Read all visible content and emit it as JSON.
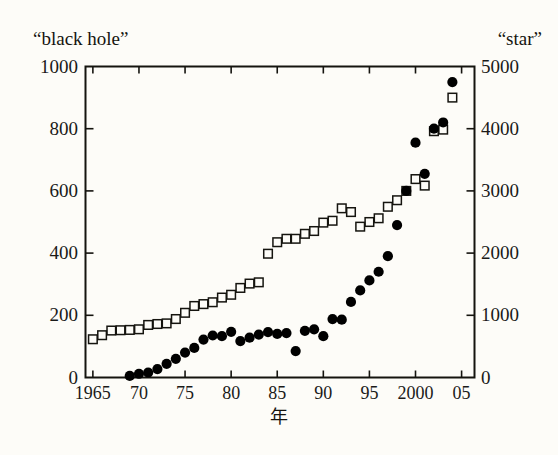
{
  "figure": {
    "background_color": "#fdfcf8",
    "ink_color": "#15140f",
    "left_header": "“black hole”",
    "right_header": "“star”",
    "xaxis_title": "年"
  },
  "chart_data": {
    "type": "scatter",
    "title": "",
    "subtitle": "",
    "xlabel": "年",
    "ylabel": "“black hole”",
    "y2label": "“star”",
    "xlim": [
      1964.2,
      2006.4
    ],
    "ylim": [
      0,
      1000
    ],
    "y2lim": [
      0,
      5000
    ],
    "grid": false,
    "legend_position": "none",
    "xticks": [
      1965,
      1970,
      1975,
      1980,
      1985,
      1990,
      1995,
      2000,
      2005
    ],
    "xtick_labels": [
      "1965",
      "70",
      "75",
      "80",
      "85",
      "90",
      "95",
      "2000",
      "05"
    ],
    "yticks": [
      0,
      200,
      400,
      600,
      800,
      1000
    ],
    "ytick_labels": [
      "0",
      "200",
      "400",
      "600",
      "800",
      "1000"
    ],
    "y2ticks": [
      0,
      1000,
      2000,
      3000,
      4000,
      5000
    ],
    "y2tick_labels": [
      "0",
      "1000",
      "2000",
      "3000",
      "4000",
      "5000"
    ],
    "series": [
      {
        "name": "“star”",
        "marker": "open-square",
        "axis": "right",
        "color": "#15140f",
        "x": [
          1965,
          1966,
          1967,
          1968,
          1969,
          1970,
          1971,
          1972,
          1973,
          1974,
          1975,
          1976,
          1977,
          1978,
          1979,
          1980,
          1981,
          1982,
          1983,
          1984,
          1985,
          1986,
          1987,
          1988,
          1989,
          1990,
          1991,
          1992,
          1993,
          1994,
          1995,
          1996,
          1997,
          1998,
          1999,
          2000,
          2001,
          2002,
          2003,
          2004
        ],
        "values": [
          615,
          680,
          755,
          760,
          765,
          775,
          845,
          860,
          870,
          940,
          1040,
          1150,
          1180,
          1210,
          1285,
          1330,
          1440,
          1510,
          1530,
          1990,
          2175,
          2230,
          2230,
          2310,
          2355,
          2490,
          2520,
          2720,
          2660,
          2425,
          2500,
          2560,
          2745,
          2850,
          3000,
          3190,
          3085,
          3960,
          3985,
          4500
        ],
        "values_left_axis": [
          123,
          136,
          151,
          152,
          153,
          155,
          169,
          172,
          174,
          188,
          208,
          230,
          236,
          242,
          257,
          266,
          288,
          302,
          306,
          398,
          435,
          446,
          446,
          462,
          471,
          498,
          504,
          544,
          532,
          485,
          500,
          512,
          549,
          570,
          600,
          638,
          617,
          792,
          797,
          900
        ]
      },
      {
        "name": "“black hole”",
        "marker": "filled-circle",
        "axis": "left",
        "color": "#000000",
        "x": [
          1969,
          1970,
          1971,
          1972,
          1973,
          1974,
          1975,
          1976,
          1977,
          1978,
          1979,
          1980,
          1981,
          1982,
          1983,
          1984,
          1985,
          1986,
          1987,
          1988,
          1989,
          1990,
          1991,
          1992,
          1993,
          1994,
          1995,
          1996,
          1997,
          1998,
          1999,
          2000,
          2001,
          2002,
          2003,
          2004
        ],
        "values": [
          5,
          12,
          16,
          27,
          44,
          60,
          80,
          95,
          122,
          135,
          133,
          147,
          117,
          128,
          138,
          146,
          140,
          143,
          85,
          150,
          155,
          133,
          188,
          186,
          243,
          280,
          312,
          340,
          390,
          490,
          600,
          755,
          655,
          800,
          820,
          950
        ]
      }
    ],
    "annotations": []
  }
}
